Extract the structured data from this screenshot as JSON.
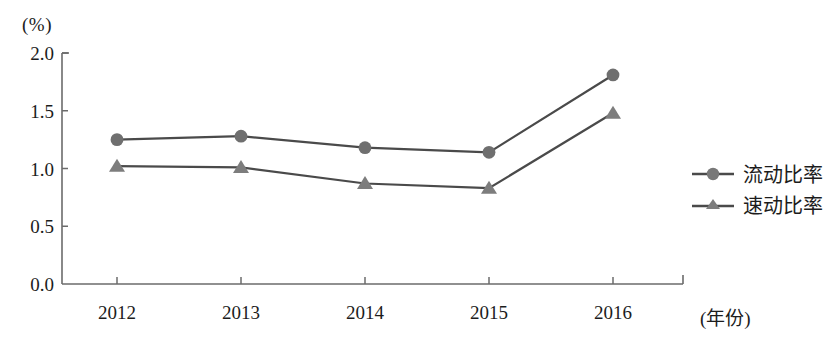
{
  "chart_data": {
    "type": "line",
    "title": "",
    "xlabel": "(年份)",
    "ylabel": "(%)",
    "categories": [
      "2012",
      "2013",
      "2014",
      "2015",
      "2016"
    ],
    "ylim": [
      0.0,
      2.0
    ],
    "ytick_labels": [
      "0.0",
      "0.5",
      "1.0",
      "1.5",
      "2.0"
    ],
    "ytick_values": [
      0.0,
      0.5,
      1.0,
      1.5,
      2.0
    ],
    "grid": false,
    "legend_position": "right",
    "series": [
      {
        "name": "流动比率",
        "marker": "circle",
        "color": "#6f6f6f",
        "values": [
          1.25,
          1.28,
          1.18,
          1.14,
          1.81
        ]
      },
      {
        "name": "速动比率",
        "marker": "triangle",
        "color": "#7d7d7d",
        "values": [
          1.02,
          1.01,
          0.87,
          0.83,
          1.48
        ]
      }
    ]
  },
  "axis": {
    "unit_label": "(%)",
    "x_title": "(年份)"
  },
  "legend": {
    "items": [
      {
        "label": "流动比率",
        "marker": "circle-marker-icon"
      },
      {
        "label": "速动比率",
        "marker": "triangle-marker-icon"
      }
    ]
  },
  "colors": {
    "axis": "#6b6b6b",
    "line": "#4a4a4a",
    "marker": "#787878",
    "text": "#1c1c1c"
  }
}
